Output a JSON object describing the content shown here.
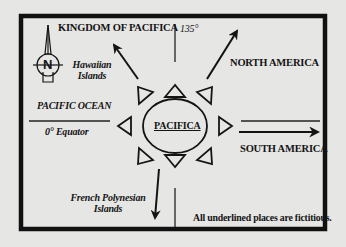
{
  "diagram": {
    "type": "fictional-map",
    "colors": {
      "background": "#e6e6e4",
      "ink": "#141414",
      "frame": "#111111"
    },
    "center": {
      "label": "PACIFICA",
      "underlined": true,
      "shape": "sun-oval-with-8-triangles"
    },
    "labels": {
      "kingdom": "KINGDOM OF PACIFICA",
      "meridian": "135°",
      "hawaiian_line1": "Hawaiian",
      "hawaiian_line2": "Islands",
      "north_america": "NORTH AMERICA",
      "pacific_ocean": "PACIFIC OCEAN",
      "equator": "0° Equator",
      "south_america": "SOUTH AMERICA",
      "french_line1": "French Polynesian",
      "french_line2": "Islands",
      "note": "All underlined places are fictitious."
    },
    "compass": {
      "label": "N",
      "icon": "north-arrow-compass"
    },
    "arrows": [
      {
        "to": "KINGDOM OF PACIFICA",
        "direction": "northwest"
      },
      {
        "to": "NORTH AMERICA",
        "direction": "northeast"
      },
      {
        "to": "SOUTH AMERICA",
        "direction": "east"
      },
      {
        "to": "French Polynesian Islands",
        "direction": "south"
      }
    ]
  }
}
